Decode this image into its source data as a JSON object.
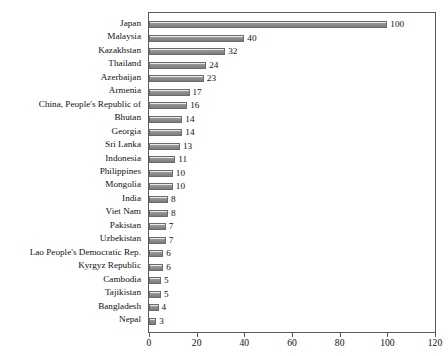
{
  "chart_data": {
    "type": "bar",
    "orientation": "horizontal",
    "title": "",
    "xlabel": "",
    "ylabel": "",
    "xlim": [
      0,
      120
    ],
    "xticks": [
      0,
      20,
      40,
      60,
      80,
      100,
      120
    ],
    "grid": false,
    "legend": false,
    "show_value_labels": true,
    "bar_color": "#7b7b7b",
    "bar_border_color": "#6b6b6b",
    "axis_color": "#5a5a5a",
    "categories": [
      "Japan",
      "Malaysia",
      "Kazakhstan",
      "Thailand",
      "Azerbaijan",
      "Armenia",
      "China, People's Republic of",
      "Bhutan",
      "Georgia",
      "Sri Lanka",
      "Indonesia",
      "Philippines",
      "Mongolia",
      "India",
      "Viet Nam",
      "Pakistan",
      "Uzbekistan",
      "Lao People's Democratic Rep.",
      "Kyrgyz Republic",
      "Cambodia",
      "Tajikistan",
      "Bangladesh",
      "Nepal"
    ],
    "values": [
      100,
      40,
      32,
      24,
      23,
      17,
      16,
      14,
      14,
      13,
      11,
      10,
      10,
      8,
      8,
      7,
      7,
      6,
      6,
      5,
      5,
      4,
      3
    ]
  }
}
